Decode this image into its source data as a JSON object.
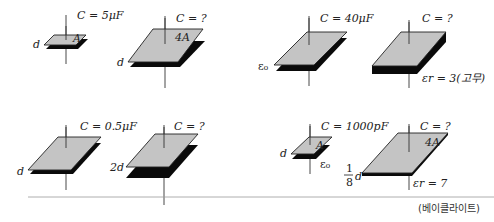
{
  "figure": {
    "panels": [
      {
        "id": "area",
        "given": {
          "label": "C = 5μF",
          "area": "A",
          "gap": "d"
        },
        "unknown": {
          "label": "C = ?",
          "area": "4A",
          "gap": "d"
        }
      },
      {
        "id": "dielectric",
        "given": {
          "label": "C = 40μF",
          "medium": "ε₀"
        },
        "unknown": {
          "label": "C = ?",
          "medium": "εr = 3(고무)"
        }
      },
      {
        "id": "distance",
        "given": {
          "label": "C = 0.5μF",
          "gap": "d"
        },
        "unknown": {
          "label": "C = ?",
          "gap": "2d"
        }
      },
      {
        "id": "combined",
        "given": {
          "label": "C = 1000pF",
          "area": "A",
          "gap": "d",
          "medium": "ε₀"
        },
        "unknown": {
          "label": "C = ?",
          "area": "4A",
          "gap_num": "1",
          "gap_den": "8",
          "gap_var": "d",
          "medium": "εr = 7",
          "material": "(베이클라이트)"
        }
      }
    ],
    "colors": {
      "plate_top": "#c4c4c4",
      "plate_bottom": "#0a0a0a",
      "rule": "#999999"
    }
  }
}
